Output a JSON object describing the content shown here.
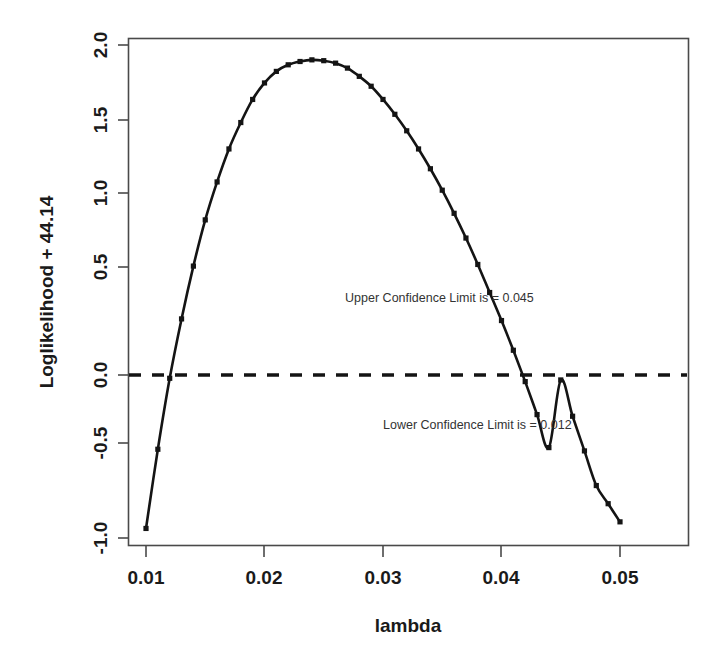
{
  "chart_data": {
    "type": "line",
    "title": "",
    "xlabel": "lambda",
    "ylabel": "Loglikelihood + 44.14",
    "xlim": [
      0.0094,
      0.0506
    ],
    "ylim": [
      -1.05,
      2.05
    ],
    "grid": false,
    "legend": null,
    "xticks": [
      0.01,
      0.02,
      0.03,
      0.04,
      0.05
    ],
    "xtick_labels": [
      "0.01",
      "0.02",
      "0.03",
      "0.04",
      "0.05"
    ],
    "yticks": [
      -1.0,
      -0.5,
      0.0,
      0.5,
      1.0,
      1.5,
      2.0
    ],
    "ytick_labels": [
      "-1.0",
      "-0.5",
      "0.0",
      "0.5",
      "1.0",
      "1.5",
      "2.0"
    ],
    "series": [
      {
        "name": "profile loglikelihood",
        "marker": "square",
        "line_style": "solid",
        "color": "#141414",
        "x": [
          0.01,
          0.011,
          0.012,
          0.013,
          0.014,
          0.015,
          0.016,
          0.017,
          0.018,
          0.019,
          0.02,
          0.021,
          0.022,
          0.023,
          0.024,
          0.025,
          0.026,
          0.027,
          0.028,
          0.029,
          0.03,
          0.031,
          0.032,
          0.033,
          0.034,
          0.035,
          0.036,
          0.037,
          0.038,
          0.039,
          0.04,
          0.041,
          0.042,
          0.043,
          0.044,
          0.045,
          0.046,
          0.047,
          0.048,
          0.049,
          0.05
        ],
        "y": [
          -0.93,
          -0.45,
          -0.02,
          0.34,
          0.66,
          0.94,
          1.17,
          1.37,
          1.53,
          1.67,
          1.77,
          1.84,
          1.88,
          1.9,
          1.91,
          1.905,
          1.89,
          1.86,
          1.81,
          1.75,
          1.67,
          1.58,
          1.48,
          1.37,
          1.25,
          1.12,
          0.98,
          0.83,
          0.67,
          0.5,
          0.33,
          0.15,
          -0.04,
          -0.24,
          -0.44,
          -0.03,
          -0.25,
          -0.46,
          -0.67,
          -0.78,
          -0.89
        ]
      }
    ],
    "reference_lines": [
      {
        "name": "chi-square-threshold",
        "orientation": "horizontal",
        "y": 0.0,
        "style": "dashed"
      }
    ],
    "annotations": [
      {
        "name": "upper-confidence-limit",
        "text": "Upper Confidence Limit is = 0.045",
        "x": 0.0268,
        "y": 0.44
      },
      {
        "name": "lower-confidence-limit",
        "text": "Lower Confidence Limit is = 0.012",
        "x": 0.03,
        "y": -0.33
      }
    ],
    "confidence_limits": {
      "lower": 0.012,
      "upper": 0.045
    }
  },
  "axes": {
    "x_title": "lambda",
    "y_title": "Loglikelihood + 44.14"
  },
  "colors": {
    "curve": "#141414",
    "frame": "#4a4a4a",
    "text": "#1a1a1a",
    "annotation": "#333333",
    "background": "#ffffff"
  }
}
